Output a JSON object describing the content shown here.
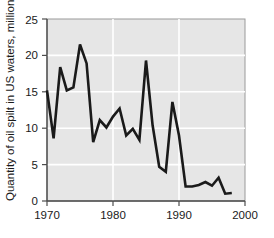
{
  "chart_data": {
    "type": "line",
    "title": "",
    "subtitle": "",
    "xlabel": "",
    "ylabel": "Quantity of oil spilt in US waters, million gallons",
    "xlim": [
      1970,
      2000
    ],
    "ylim": [
      0,
      25
    ],
    "xticks": [
      1970,
      1980,
      1990,
      2000
    ],
    "xtick_labels": [
      "1970",
      "1980",
      "1990",
      "2000"
    ],
    "yticks": [
      0,
      5,
      10,
      15,
      20,
      25
    ],
    "ytick_labels": [
      "0",
      "5",
      "10",
      "15",
      "20",
      "25"
    ],
    "grid": "horizontal-and-vertical-white-gridlines",
    "legend": "none",
    "legend_position": "none",
    "plot_background": "#e6e6e6",
    "gridline_color": "#ffffff",
    "line_color": "#1a1a1a",
    "line_width": 2.6,
    "series": [
      {
        "name": "Quantity of oil spilt in US waters",
        "x": [
          1970,
          1971,
          1972,
          1973,
          1974,
          1975,
          1976,
          1977,
          1978,
          1979,
          1980,
          1981,
          1982,
          1983,
          1984,
          1985,
          1986,
          1987,
          1988,
          1989,
          1990,
          1991,
          1992,
          1993,
          1994,
          1995,
          1996,
          1997,
          1998
        ],
        "values": [
          15.2,
          8.6,
          18.4,
          15.2,
          15.6,
          21.5,
          18.9,
          8.1,
          11.1,
          10.1,
          11.6,
          12.7,
          9.0,
          9.9,
          8.4,
          19.3,
          10.4,
          4.7,
          4.0,
          13.6,
          9.0,
          2.0,
          2.0,
          2.2,
          2.6,
          2.1,
          3.2,
          1.0,
          1.1
        ]
      }
    ],
    "annotations": []
  },
  "axes": {
    "y_axis_title": "Quantity of oil spilt in US waters, million gallons",
    "y_tick_0": "0",
    "y_tick_5": "5",
    "y_tick_10": "10",
    "y_tick_15": "15",
    "y_tick_20": "20",
    "y_tick_25": "25",
    "x_tick_1970": "1970",
    "x_tick_1980": "1980",
    "x_tick_1990": "1990",
    "x_tick_2000": "2000"
  }
}
